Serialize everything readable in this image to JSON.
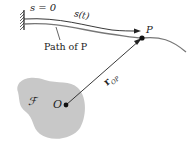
{
  "diagram": {
    "labels": {
      "s_zero": "s = 0",
      "s_t": "s(t)",
      "path_of_p": "Path of P",
      "point_p": "P",
      "origin_o": "O",
      "vector_r": "r",
      "vector_r_sub": "OP",
      "frame_f": "ℱ"
    },
    "colors": {
      "frame_fill": "#c8c8c8",
      "path_stroke": "#777777",
      "ink": "#222222"
    }
  }
}
